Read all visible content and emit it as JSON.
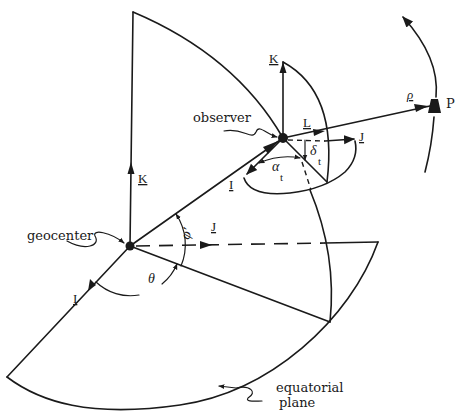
{
  "diagram": {
    "labels": {
      "observer": "observer",
      "geocenter": "geocenter",
      "equatorial": "equatorial",
      "plane": "plane",
      "K_main": "K",
      "K_local": "K",
      "L": "L",
      "J_local": "J",
      "J_main": "J",
      "I_local": "I",
      "I_main": "I",
      "rho": "ρ",
      "P": "P",
      "delta": "δ",
      "delta_sub": "t",
      "alpha": "α",
      "alpha_sub": "t",
      "phi": "φ'",
      "theta": "θ"
    },
    "colors": {
      "ink": "#1a1a1a",
      "background": "#ffffff"
    }
  }
}
